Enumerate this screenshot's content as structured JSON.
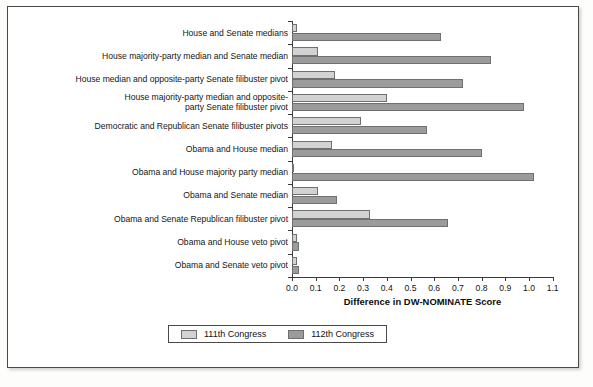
{
  "chart_data": {
    "type": "bar",
    "orientation": "horizontal",
    "title": "",
    "xlabel": "Difference in DW-NOMINATE Score",
    "ylabel": "",
    "xlim": [
      0.0,
      1.1
    ],
    "xticks": [
      "0.0",
      "0.1",
      "0.2",
      "0.3",
      "0.4",
      "0.5",
      "0.6",
      "0.7",
      "0.8",
      "0.9",
      "1.0",
      "1.1"
    ],
    "grid": false,
    "legend_position": "bottom",
    "categories": [
      "House and Senate medians",
      "House majority-party median and Senate median",
      "House median and opposite-party Senate filibuster pivot",
      "House majority-party median and opposite-\nparty Senate filibuster pivot",
      "Democratic and Republican Senate filibuster pivots",
      "Obama and House median",
      "Obama and House majority party median",
      "Obama and Senate median",
      "Obama and Senate Republican filibuster pivot",
      "Obama and House veto pivot",
      "Obama and Senate veto pivot"
    ],
    "series": [
      {
        "name": "111th Congress",
        "color": "#d2d2d2",
        "values": [
          0.02,
          0.11,
          0.18,
          0.4,
          0.29,
          0.17,
          0.01,
          0.11,
          0.33,
          0.02,
          0.02
        ]
      },
      {
        "name": "112th Congress",
        "color": "#9b9b9b",
        "values": [
          0.63,
          0.84,
          0.72,
          0.98,
          0.57,
          0.8,
          1.02,
          0.19,
          0.66,
          0.03,
          0.03
        ]
      }
    ]
  },
  "legend": {
    "items": [
      {
        "label": "111th Congress",
        "swatch": "light-gray-swatch"
      },
      {
        "label": "112th Congress",
        "swatch": "dark-gray-swatch"
      }
    ]
  }
}
